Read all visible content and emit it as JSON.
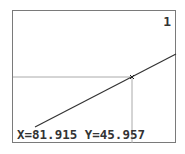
{
  "calculator": {
    "mode": "trace",
    "graph_index": "1",
    "trace": {
      "x_label": "X=81.915",
      "y_label": "Y=45.957",
      "x": 81.915,
      "y": 45.957
    },
    "colors": {
      "frame": "#7a7a7a",
      "graph_line": "#333333",
      "crosshair": "#aaaaaa",
      "background": "#ffffff"
    }
  }
}
